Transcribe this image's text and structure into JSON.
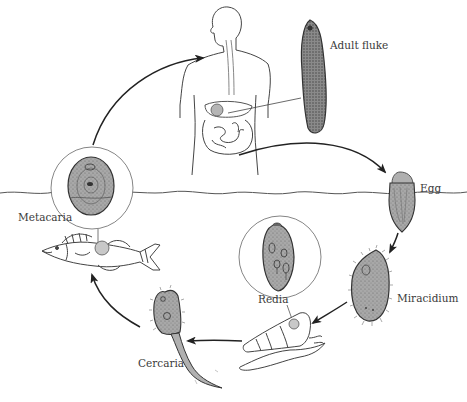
{
  "diagram": {
    "type": "life-cycle",
    "colors": {
      "line": "#2a2a2a",
      "organism_fill": "#a9a9a9",
      "organism_dark": "#6e6e6e",
      "background": "#ffffff"
    },
    "stages": [
      {
        "id": "adult",
        "label": "Adult fluke",
        "host": "human"
      },
      {
        "id": "egg",
        "label": "Egg",
        "host": "water"
      },
      {
        "id": "miracidium",
        "label": "Miracidium",
        "host": "water"
      },
      {
        "id": "redia",
        "label": "Redia",
        "host": "snail"
      },
      {
        "id": "cercaria",
        "label": "Cercaria",
        "host": "water"
      },
      {
        "id": "metacaria",
        "label": "Metacaria",
        "host": "fish"
      }
    ],
    "labels": {
      "adult": "Adult fluke",
      "egg": "Egg",
      "miracidium": "Miracidium",
      "redia": "Redia",
      "cercaria": "Cercaria",
      "metacaria": "Metacaria"
    },
    "cycle_order": [
      "Adult fluke",
      "Egg",
      "Miracidium",
      "Redia",
      "Cercaria",
      "Metacaria"
    ]
  }
}
